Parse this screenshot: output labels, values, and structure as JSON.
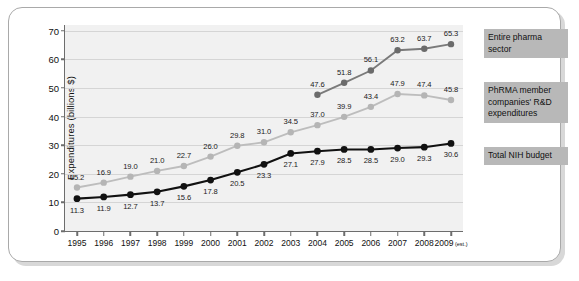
{
  "chart_data": {
    "type": "line",
    "title": "",
    "xlabel": "",
    "ylabel": "Expenditures (billions $)",
    "ylim": [
      0,
      72
    ],
    "yticks": [
      0,
      10,
      20,
      30,
      40,
      50,
      60,
      70
    ],
    "ytick_labels": [
      "0",
      "10",
      "20",
      "30",
      "40",
      "50",
      "60",
      "70"
    ],
    "grid": true,
    "legend_position": "right",
    "categories": [
      1995,
      1996,
      1997,
      1998,
      1999,
      2000,
      2001,
      2002,
      2003,
      2004,
      2005,
      2006,
      2007,
      2008,
      2009
    ],
    "xtick_labels": [
      "1995",
      "1996",
      "1997",
      "1998",
      "1999",
      "2000",
      "2001",
      "2002",
      "2003",
      "2004",
      "2005",
      "2006",
      "2007",
      "2008",
      "2009"
    ],
    "last_xtick_suffix": "(est.)",
    "series": [
      {
        "name": "Entire pharma sector",
        "color": "#7a7a7a",
        "marker_color": "#6b6b6b",
        "x": [
          2004,
          2005,
          2006,
          2007,
          2008,
          2009
        ],
        "values": [
          47.6,
          51.8,
          56.1,
          63.2,
          63.7,
          65.3
        ],
        "labels": [
          "47.6",
          "51.8",
          "56.1",
          "63.2",
          "63.7",
          "65.3"
        ]
      },
      {
        "name": "PhRMA member companies' R&D expenditures",
        "color": "#bdbdbd",
        "marker_color": "#b5b5b5",
        "x": [
          1995,
          1996,
          1997,
          1998,
          1999,
          2000,
          2001,
          2002,
          2003,
          2004,
          2005,
          2006,
          2007,
          2008,
          2009
        ],
        "values": [
          15.2,
          16.9,
          19.0,
          21.0,
          22.7,
          26.0,
          29.8,
          31.0,
          34.5,
          37.0,
          39.9,
          43.4,
          47.9,
          47.4,
          45.8
        ],
        "labels": [
          "15.2",
          "16.9",
          "19.0",
          "21.0",
          "22.7",
          "26.0",
          "29.8",
          "31.0",
          "34.5",
          "37.0",
          "39.9",
          "43.4",
          "47.9",
          "47.4",
          "45.8"
        ]
      },
      {
        "name": "Total NIH budget",
        "color": "#111111",
        "marker_color": "#111111",
        "x": [
          1995,
          1996,
          1997,
          1998,
          1999,
          2000,
          2001,
          2002,
          2003,
          2004,
          2005,
          2006,
          2007,
          2008,
          2009
        ],
        "values": [
          11.3,
          11.9,
          12.7,
          13.7,
          15.6,
          17.8,
          20.5,
          23.3,
          27.1,
          27.9,
          28.5,
          28.5,
          29.0,
          29.3,
          30.6
        ],
        "labels": [
          "11.3",
          "11.9",
          "12.7",
          "13.7",
          "15.6",
          "17.8",
          "20.5",
          "23.3",
          "27.1",
          "27.9",
          "28.5",
          "28.5",
          "29.0",
          "29.3",
          "30.6"
        ]
      }
    ]
  },
  "legend": {
    "entire_pharma": "Entire pharma sector",
    "phrma_members": "PhRMA member companies' R&D expenditures",
    "total_nih": "Total NIH budget"
  },
  "colors": {
    "plot_background": "#f1f1f1",
    "frame_border": "#a9a9a9",
    "gridline": "#d5d5d5",
    "legend_background": "#b8b8b8",
    "axis": "#6d6d6d"
  }
}
